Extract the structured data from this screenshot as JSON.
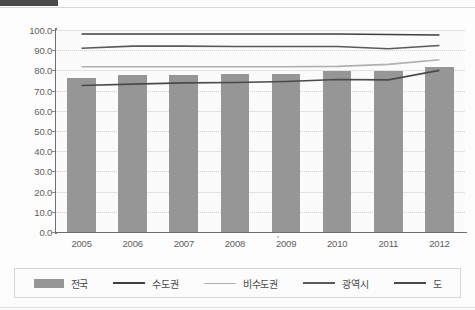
{
  "chart_data": {
    "type": "bar",
    "title": "",
    "xlabel": "",
    "ylabel": "",
    "categories": [
      "2005",
      "2006",
      "2007",
      "2008",
      "2009",
      "2010",
      "2011",
      "2012"
    ],
    "ylim": [
      0.0,
      100.0
    ],
    "ytick_step": 10.0,
    "ytick_labels": [
      "100.0",
      "90.0",
      "80.0",
      "70.0",
      "60.0",
      "50.0",
      "40.0",
      "30.0",
      "20.0",
      "10.0",
      "0.0"
    ],
    "ytick_values": [
      100.0,
      90.0,
      80.0,
      70.0,
      60.0,
      50.0,
      40.0,
      30.0,
      20.0,
      10.0,
      0.0
    ],
    "grid": true,
    "legend_position": "bottom",
    "series": [
      {
        "name": "전국",
        "kind": "bar",
        "color": "#969696",
        "values": [
          76.2,
          77.5,
          77.5,
          78.0,
          78.3,
          79.5,
          79.5,
          81.5
        ]
      },
      {
        "name": "수도권",
        "kind": "line",
        "color": "#3f3f3f",
        "values": [
          98.0,
          98.0,
          98.0,
          98.0,
          98.0,
          98.0,
          97.8,
          97.5
        ]
      },
      {
        "name": "비수도권",
        "kind": "line",
        "color": "#b0b0b0",
        "values": [
          81.8,
          81.8,
          81.8,
          81.8,
          81.8,
          82.0,
          83.0,
          85.3
        ]
      },
      {
        "name": "광역시",
        "kind": "line",
        "color": "#5a5a5a",
        "values": [
          91.0,
          92.0,
          92.0,
          91.8,
          91.8,
          91.8,
          90.7,
          92.3
        ]
      },
      {
        "name": "도",
        "kind": "line",
        "color": "#4a4a4a",
        "values": [
          72.5,
          73.2,
          73.8,
          74.0,
          74.5,
          75.5,
          75.3,
          80.0
        ]
      }
    ]
  },
  "legend": {
    "items": [
      {
        "label": "전국",
        "marker": "bar-swatch",
        "color": "#969696"
      },
      {
        "label": "수도권",
        "marker": "line-swatch",
        "color": "#3f3f3f"
      },
      {
        "label": "비수도권",
        "marker": "line-swatch",
        "color": "#b0b0b0"
      },
      {
        "label": "광역시",
        "marker": "line-swatch",
        "color": "#5a5a5a"
      },
      {
        "label": "도",
        "marker": "line-swatch",
        "color": "#4a4a4a"
      }
    ]
  }
}
